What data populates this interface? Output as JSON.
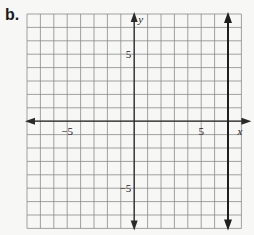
{
  "part_label": "b.",
  "chart_data": {
    "type": "line",
    "title": "",
    "xlabel": "x",
    "ylabel": "y",
    "xlim": [
      -8,
      8
    ],
    "ylim": [
      -8,
      8
    ],
    "grid": true,
    "grid_step": 1,
    "tick_labels": {
      "x": [
        {
          "value": -5,
          "label": "−5"
        },
        {
          "value": 5,
          "label": "5"
        }
      ],
      "y": [
        {
          "value": 5,
          "label": "5"
        },
        {
          "value": -5,
          "label": "−5"
        }
      ]
    },
    "series": [
      {
        "name": "vertical line",
        "equation": "x = 7",
        "points": [
          [
            7,
            -8
          ],
          [
            7,
            8
          ]
        ],
        "arrows": "both"
      }
    ],
    "colors": {
      "grid": "#8a8a8a",
      "axis": "#2a2a2a",
      "line": "#1f1f1f",
      "background": "#f7f7f5"
    }
  }
}
